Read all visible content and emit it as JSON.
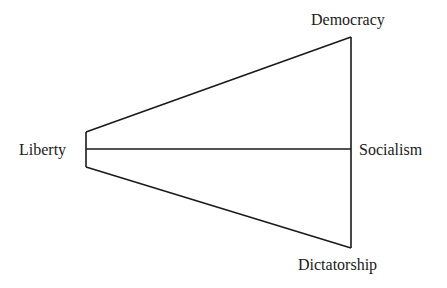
{
  "diagram": {
    "type": "political-spectrum-fan",
    "nodes": [
      {
        "id": "liberty",
        "label": "Liberty"
      },
      {
        "id": "democracy",
        "label": "Democracy"
      },
      {
        "id": "socialism",
        "label": "Socialism"
      },
      {
        "id": "dictatorship",
        "label": "Dictatorship"
      }
    ],
    "edges": [
      {
        "from": "liberty",
        "to": "democracy"
      },
      {
        "from": "liberty",
        "to": "socialism"
      },
      {
        "from": "liberty",
        "to": "dictatorship"
      },
      {
        "from": "democracy",
        "to": "dictatorship",
        "via": "socialism"
      }
    ],
    "line_color": "#1a1a1a"
  }
}
